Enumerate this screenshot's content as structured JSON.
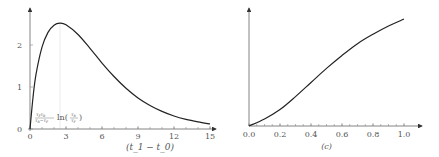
{
  "chart_data": [
    {
      "type": "line",
      "title": "",
      "xlabel": "(t_1 − t_0)",
      "ylabel": "",
      "xlim": [
        0,
        15
      ],
      "ylim": [
        0,
        2.7
      ],
      "xticks": [
        0,
        3,
        6,
        9,
        12,
        15
      ],
      "xtick_labels": [
        "0",
        "3",
        "6",
        "9",
        "12",
        "15"
      ],
      "yticks": [
        0,
        1,
        2
      ],
      "ytick_labels": [
        "0",
        "1",
        "2"
      ],
      "annotation": "τ_Fτ_R/(τ_R−τ_F) ln(τ_R/τ_F)",
      "annotation_x": 2.5,
      "series": [
        {
          "name": "curve",
          "x": [
            0,
            0.25,
            0.5,
            1,
            1.5,
            2,
            2.5,
            3,
            4,
            5,
            6,
            7,
            8,
            9,
            10,
            11,
            12,
            13,
            14,
            15
          ],
          "y": [
            0,
            0.75,
            1.3,
            1.95,
            2.3,
            2.47,
            2.52,
            2.48,
            2.25,
            1.92,
            1.57,
            1.25,
            0.97,
            0.74,
            0.56,
            0.42,
            0.31,
            0.23,
            0.17,
            0.12
          ]
        }
      ],
      "grid": false
    },
    {
      "type": "line",
      "title": "",
      "xlabel": "(c)",
      "ylabel": "",
      "xlim": [
        0,
        1.0
      ],
      "ylim": [
        0,
        1.0
      ],
      "xticks": [
        0,
        0.2,
        0.4,
        0.6,
        0.8,
        1.0
      ],
      "xtick_labels": [
        "0.0",
        "0.2",
        "0.4",
        "0.6",
        "0.8",
        "1.0"
      ],
      "series": [
        {
          "name": "curve",
          "x": [
            0,
            0.1,
            0.2,
            0.3,
            0.4,
            0.5,
            0.6,
            0.7,
            0.8,
            0.9,
            1.0
          ],
          "y": [
            0,
            0.06,
            0.14,
            0.25,
            0.37,
            0.49,
            0.6,
            0.7,
            0.78,
            0.85,
            0.91
          ]
        }
      ],
      "grid": false
    }
  ]
}
